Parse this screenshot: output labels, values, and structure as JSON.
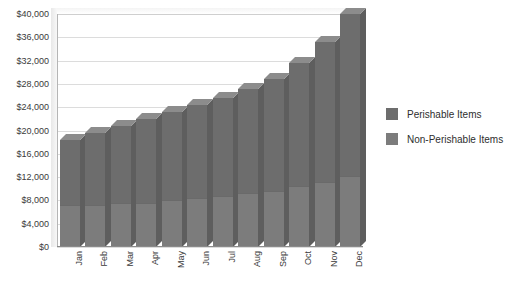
{
  "chart_data": {
    "type": "bar",
    "subtype": "stacked-bar-3d",
    "title": "",
    "xlabel": "",
    "ylabel": "",
    "categories": [
      "Jan",
      "Feb",
      "Mar",
      "Apr",
      "May",
      "Jun",
      "Jul",
      "Aug",
      "Sep",
      "Oct",
      "Nov",
      "Dec"
    ],
    "series": [
      {
        "name": "Perishable Items",
        "color": "#6d6d6d",
        "values": [
          11200,
          12400,
          13200,
          14400,
          15200,
          16000,
          16800,
          18000,
          19200,
          21200,
          24000,
          27800
        ]
      },
      {
        "name": "Non-Perishable Items",
        "color": "#7c7c7c",
        "values": [
          7200,
          7200,
          7600,
          7600,
          8000,
          8400,
          8800,
          9200,
          9600,
          10400,
          11200,
          12200
        ]
      }
    ],
    "totals": [
      18400,
      19600,
      20800,
      22000,
      23200,
      24400,
      25600,
      27200,
      28800,
      31600,
      35200,
      40000
    ],
    "ylim": [
      0,
      40000
    ],
    "ytick_step": 4000,
    "ytick_labels": [
      "$0",
      "$4,000",
      "$8,000",
      "$12,000",
      "$16,000",
      "$20,000",
      "$24,000",
      "$28,000",
      "$32,000",
      "$36,000",
      "$40,000"
    ],
    "ytick_values": [
      0,
      4000,
      8000,
      12000,
      16000,
      20000,
      24000,
      28000,
      32000,
      36000,
      40000
    ],
    "grid": true,
    "legend_position": "right",
    "legend": [
      {
        "label": "Perishable Items",
        "color": "#6d6d6d"
      },
      {
        "label": "Non-Perishable Items",
        "color": "#7c7c7c"
      }
    ]
  }
}
